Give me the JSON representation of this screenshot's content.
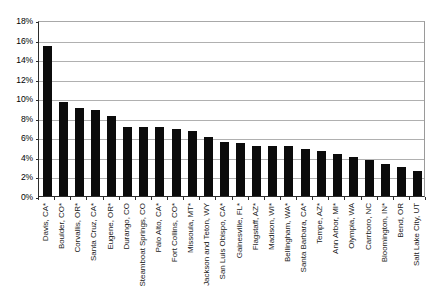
{
  "chart_data": {
    "type": "bar",
    "title": "",
    "subtitle": "",
    "xlabel": "",
    "ylabel": "",
    "ylim": [
      0,
      18
    ],
    "ytick_labels": [
      "18%",
      "16%",
      "14%",
      "12%",
      "10%",
      "8%",
      "6%",
      "4%",
      "2%",
      "0%"
    ],
    "ytick_values": [
      18,
      16,
      14,
      12,
      10,
      8,
      6,
      4,
      2,
      0
    ],
    "grid": true,
    "legend": "none",
    "bar_color": "#0b0b0b",
    "value_unit": "%",
    "categories": [
      "Davis, CA*",
      "Boulder, CO*",
      "Corvallis, OR*",
      "Santa Cruz, CA*",
      "Eugene, OR*",
      "Durango, CO",
      "Steamboat Springs, CO",
      "Palo Alto, CA*",
      "Fort Collins, CO*",
      "Missoula, MT*",
      "Jackson and Teton, WY",
      "San Luis Obispo, CA*",
      "Gainesville, FL*",
      "Flagstaff, AZ*",
      "Madison, WI*",
      "Bellingham, WA*",
      "Santa Barbara, CA*",
      "Tempe, AZ*",
      "Ann Arbor, MI*",
      "Olympia, WA",
      "Carrboro, NC",
      "Bloomington, IN*",
      "Bend, OR",
      "Salt Lake City, UT"
    ],
    "values": [
      15.3,
      9.6,
      9.0,
      8.8,
      8.2,
      7.1,
      7.1,
      7.1,
      6.9,
      6.6,
      6.0,
      5.5,
      5.4,
      5.1,
      5.1,
      5.1,
      4.8,
      4.6,
      4.3,
      4.0,
      3.7,
      3.3,
      3.0,
      2.6
    ]
  }
}
